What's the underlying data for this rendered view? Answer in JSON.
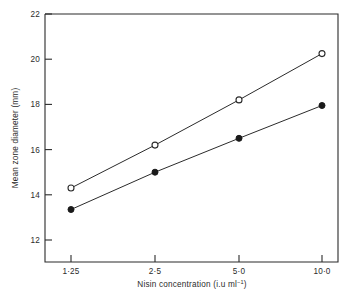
{
  "chart_data": {
    "type": "line",
    "title": "",
    "xlabel": "Nisin concentration (i.u ml⁻¹)",
    "ylabel": "Mean zone diameter (mm)",
    "categories": [
      "1·25",
      "2·5",
      "5·0",
      "10·0"
    ],
    "x_values": [
      1.25,
      2.5,
      5.0,
      10.0
    ],
    "x_scale": "log",
    "ylim": [
      11,
      22
    ],
    "ytick_labels": [
      "12",
      "14",
      "16",
      "18",
      "20",
      "22"
    ],
    "ytick_values": [
      12,
      14,
      16,
      18,
      20,
      22
    ],
    "grid": false,
    "legend": "none",
    "series": [
      {
        "name": "open-circle-series",
        "marker": "open-circle",
        "values": [
          14.3,
          16.2,
          18.2,
          20.25
        ]
      },
      {
        "name": "filled-circle-series",
        "marker": "filled-circle",
        "values": [
          13.35,
          15.0,
          16.5,
          17.95
        ]
      }
    ]
  },
  "axis": {
    "y_title": "Mean zone diameter (mm)",
    "x_title_main": "Nisin  concentration (i.u ml",
    "x_title_sup": "−1",
    "x_title_tail": ")"
  },
  "ylabels": {
    "t22": "22",
    "t20": "20",
    "t18": "18",
    "t16": "16",
    "t14": "14",
    "t12": "12"
  },
  "xlabels": {
    "x1": "1·25",
    "x2": "2·5",
    "x3": "5·0",
    "x4": "10·0"
  },
  "caption": {
    "text": ""
  }
}
